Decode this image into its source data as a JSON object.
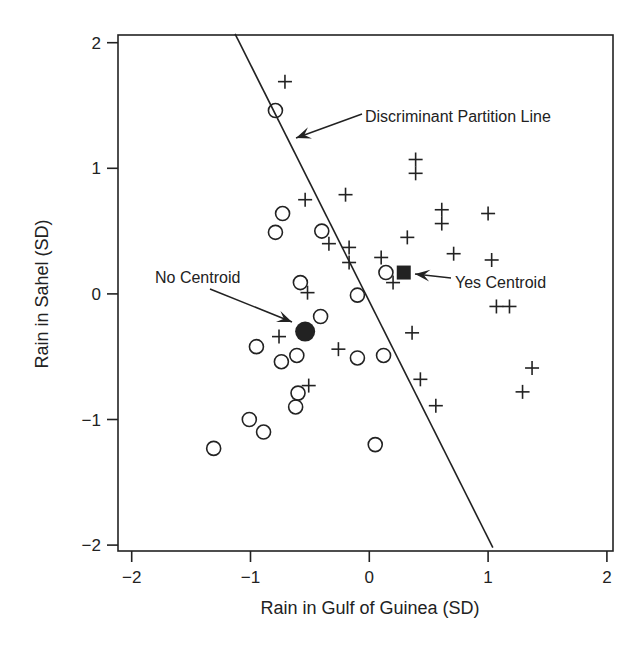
{
  "chart_data": {
    "type": "scatter",
    "title": "",
    "xlabel": "Rain in Gulf of Guinea (SD)",
    "ylabel": "Rain in Sahel (SD)",
    "xlim": [
      -2.1,
      2.07
    ],
    "ylim": [
      -2.05,
      2.07
    ],
    "xticks": [
      -2,
      -1,
      0,
      1,
      2
    ],
    "yticks": [
      -2,
      -1,
      0,
      1,
      2
    ],
    "xtick_labels": [
      "−2",
      "−1",
      "0",
      "1",
      "2"
    ],
    "ytick_labels": [
      "−2",
      "−1",
      "0",
      "1",
      "2"
    ],
    "grid": false,
    "legend": "none",
    "series": [
      {
        "name": "Yes",
        "marker": "plus",
        "points": [
          [
            -0.71,
            1.69
          ],
          [
            0.39,
            1.07
          ],
          [
            0.39,
            0.96
          ],
          [
            -0.54,
            0.75
          ],
          [
            -0.2,
            0.79
          ],
          [
            0.61,
            0.67
          ],
          [
            0.61,
            0.56
          ],
          [
            1.0,
            0.64
          ],
          [
            -0.34,
            0.4
          ],
          [
            -0.17,
            0.37
          ],
          [
            -0.17,
            0.25
          ],
          [
            0.32,
            0.45
          ],
          [
            0.1,
            0.29
          ],
          [
            0.71,
            0.32
          ],
          [
            1.03,
            0.27
          ],
          [
            0.2,
            0.09
          ],
          [
            -0.52,
            0.01
          ],
          [
            1.07,
            -0.1
          ],
          [
            1.18,
            -0.1
          ],
          [
            0.36,
            -0.31
          ],
          [
            -0.76,
            -0.34
          ],
          [
            -0.26,
            -0.44
          ],
          [
            0.43,
            -0.68
          ],
          [
            1.37,
            -0.59
          ],
          [
            1.29,
            -0.78
          ],
          [
            0.56,
            -0.89
          ],
          [
            -0.51,
            -0.73
          ]
        ]
      },
      {
        "name": "No",
        "marker": "circle",
        "points": [
          [
            -0.79,
            1.46
          ],
          [
            -0.73,
            0.64
          ],
          [
            -0.79,
            0.49
          ],
          [
            -0.4,
            0.5
          ],
          [
            -0.58,
            0.09
          ],
          [
            0.14,
            0.17
          ],
          [
            -0.1,
            -0.01
          ],
          [
            -0.41,
            -0.18
          ],
          [
            -0.95,
            -0.42
          ],
          [
            -0.74,
            -0.54
          ],
          [
            -0.61,
            -0.49
          ],
          [
            -0.1,
            -0.51
          ],
          [
            0.12,
            -0.49
          ],
          [
            -0.6,
            -0.79
          ],
          [
            -0.62,
            -0.9
          ],
          [
            -1.01,
            -1.0
          ],
          [
            -0.89,
            -1.1
          ],
          [
            -1.31,
            -1.23
          ],
          [
            0.05,
            -1.2
          ]
        ]
      }
    ],
    "centroids": [
      {
        "name": "No Centroid",
        "marker": "filled-circle",
        "point": [
          -0.54,
          -0.3
        ]
      },
      {
        "name": "Yes Centroid",
        "marker": "filled-square",
        "point": [
          0.29,
          0.17
        ]
      }
    ],
    "partition_line": {
      "from": [
        -1.13,
        2.07
      ],
      "to": [
        1.04,
        -2.02
      ]
    },
    "annotations": [
      {
        "text": "Discriminant Partition Line",
        "target": "partition_line"
      },
      {
        "text": "No Centroid",
        "target": "No Centroid"
      },
      {
        "text": "Yes Centroid",
        "target": "Yes Centroid"
      }
    ]
  },
  "labels": {
    "xlabel": "Rain in Gulf of Guinea (SD)",
    "ylabel": "Rain in Sahel (SD)",
    "annot_line": "Discriminant Partition Line",
    "annot_no": "No Centroid",
    "annot_yes": "Yes Centroid"
  },
  "colors": {
    "ink": "#222222",
    "background": "#ffffff"
  }
}
